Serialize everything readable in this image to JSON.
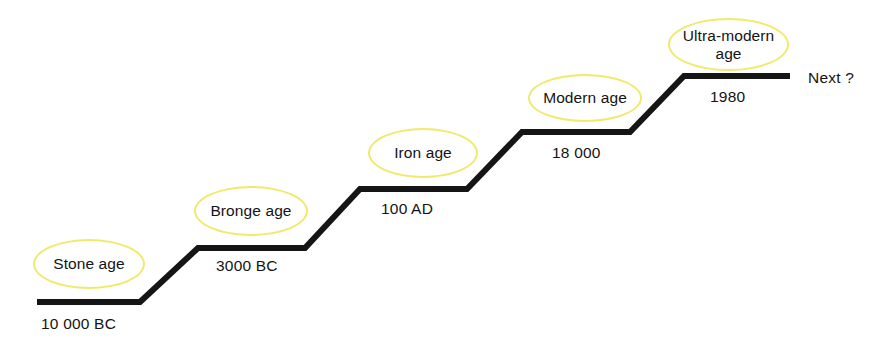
{
  "canvas": {
    "width": 884,
    "height": 348,
    "background": "#ffffff"
  },
  "style": {
    "step_line_color": "#151515",
    "step_line_width": 6,
    "bubble_stroke_color": "#f0ea6c",
    "text_color": "#141414"
  },
  "diagram": {
    "type": "staircase-timeline",
    "steps": [
      {
        "era": "Stone age",
        "date": "10 000 BC",
        "tread": {
          "x1": 37,
          "x2": 140,
          "y": 302
        },
        "bubble": {
          "x": 33,
          "y": 239,
          "w": 112,
          "h": 50
        },
        "date_pos": {
          "x": 41,
          "y": 316
        }
      },
      {
        "era": "Bronge age",
        "date": "3000 BC",
        "tread": {
          "x1": 198,
          "x2": 305,
          "y": 248
        },
        "bubble": {
          "x": 194,
          "y": 186,
          "w": 114,
          "h": 50
        },
        "date_pos": {
          "x": 216,
          "y": 258
        }
      },
      {
        "era": "Iron age",
        "date": "100 AD",
        "tread": {
          "x1": 360,
          "x2": 467,
          "y": 189
        },
        "bubble": {
          "x": 368,
          "y": 128,
          "w": 110,
          "h": 50
        },
        "date_pos": {
          "x": 381,
          "y": 201
        }
      },
      {
        "era": "Modern age",
        "date": "18 000",
        "tread": {
          "x1": 522,
          "x2": 630,
          "y": 132
        },
        "bubble": {
          "x": 528,
          "y": 74,
          "w": 114,
          "h": 48
        },
        "date_pos": {
          "x": 552,
          "y": 145
        }
      },
      {
        "era": "Ultra-modern age",
        "date": "1980",
        "tread": {
          "x1": 684,
          "x2": 790,
          "y": 76
        },
        "bubble": {
          "x": 668,
          "y": 18,
          "w": 121,
          "h": 53
        },
        "date_pos": {
          "x": 710,
          "y": 89
        }
      }
    ],
    "end_label": "Next ?",
    "end_label_pos": {
      "x": 808,
      "y": 70
    },
    "path": "M 37 302 L 140 302 L 198 248 L 305 248 L 360 189 L 467 189 L 522 132 L 630 132 L 684 76 L 790 76"
  }
}
